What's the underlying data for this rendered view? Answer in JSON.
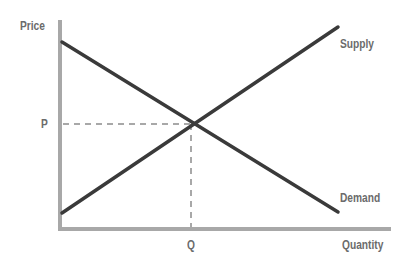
{
  "diagram": {
    "y_axis_label": "Price",
    "x_axis_label": "Quantity",
    "equilibrium_price_label": "P",
    "equilibrium_quantity_label": "Q",
    "curves": [
      {
        "name": "Supply",
        "direction": "upward-sloping"
      },
      {
        "name": "Demand",
        "direction": "downward-sloping"
      }
    ]
  },
  "colors": {
    "axis": "#a8a8a8",
    "curve": "#3a3a3a",
    "guide": "#a8a8a8",
    "text": "#6b6b6b"
  }
}
